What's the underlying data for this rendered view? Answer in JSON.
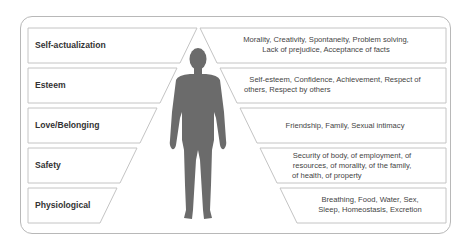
{
  "diagram": {
    "title": "",
    "colors": {
      "frame_border": "#b8b8b8",
      "box_border": "#c4c4c4",
      "silhouette": "#6b6b6b",
      "label_text": "#333333",
      "desc_text": "#444444"
    },
    "levels": [
      {
        "name": "Self-actualization",
        "desc_line1": "Morality, Creativity, Spontaneity, Problem solving,",
        "desc_line2": "Lack of prejudice, Acceptance of facts",
        "desc_line3": ""
      },
      {
        "name": "Esteem",
        "desc_line1": "Self-esteem, Confidence, Achievement, Respect of",
        "desc_line2": "others, Respect by others",
        "desc_line3": ""
      },
      {
        "name": "Love/Belonging",
        "desc_line1": "Friendship, Family, Sexual intimacy",
        "desc_line2": "",
        "desc_line3": ""
      },
      {
        "name": "Safety",
        "desc_line1": "Security of body, of employment, of",
        "desc_line2": "resources, of morality, of the family,",
        "desc_line3": "of health, of property"
      },
      {
        "name": "Physiological",
        "desc_line1": "Breathing, Food, Water, Sex,",
        "desc_line2": "Sleep, Homeostasis, Excretion",
        "desc_line3": ""
      }
    ],
    "figure": "human-silhouette"
  }
}
